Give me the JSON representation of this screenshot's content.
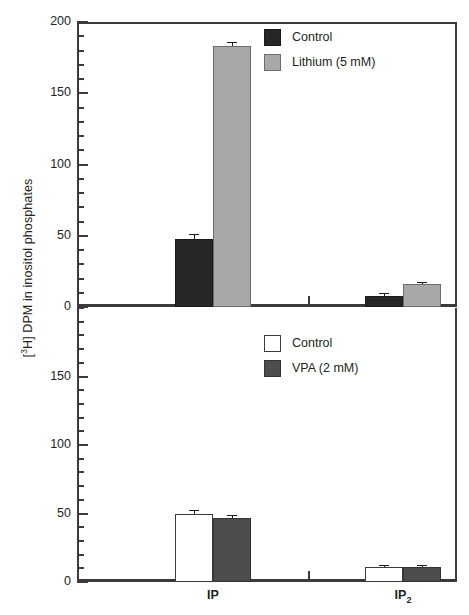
{
  "chart_data": {
    "type": "bar",
    "title": "",
    "xlabel": "",
    "ylabel": "[3H] DPM in inositol phosphates",
    "ylabel_prefix": "[",
    "ylabel_sup": "3",
    "ylabel_rest": "H] DPM in inositol phosphates",
    "categories": [
      "IP",
      "IP2"
    ],
    "category_labels": [
      {
        "base": "IP",
        "sub": ""
      },
      {
        "base": "IP",
        "sub": "2"
      }
    ],
    "panels": [
      {
        "id": "top",
        "ylim": [
          0,
          200
        ],
        "yticks": [
          0,
          50,
          100,
          150,
          200
        ],
        "ytick_labels": [
          "0",
          "50",
          "100",
          "150",
          "200"
        ],
        "minor_tick_step": 10,
        "grid": false,
        "legend_position": "top-right",
        "series": [
          {
            "name": "Control",
            "color": "#262626",
            "style": "black",
            "values": [
              48,
              8
            ],
            "errors": [
              2.5,
              1.2
            ]
          },
          {
            "name": "Lithium (5 mM)",
            "color": "#a8a8a8",
            "style": "lightgray",
            "values": [
              183,
              16
            ],
            "errors": [
              2.5,
              1.0
            ]
          }
        ]
      },
      {
        "id": "bottom",
        "ylim": [
          0,
          200
        ],
        "yticks": [
          0,
          50,
          100,
          150
        ],
        "ytick_labels": [
          "0",
          "50",
          "100",
          "150"
        ],
        "minor_tick_step": 10,
        "grid": false,
        "legend_position": "top-right",
        "series": [
          {
            "name": "Control",
            "color": "#ffffff",
            "style": "white",
            "values": [
              50,
              11
            ],
            "errors": [
              1.5,
              0.8
            ]
          },
          {
            "name": "VPA (2 mM)",
            "color": "#4d4d4d",
            "style": "darkgray",
            "values": [
              47,
              11
            ],
            "errors": [
              1.5,
              0.8
            ]
          }
        ]
      }
    ]
  },
  "legends": {
    "top": [
      {
        "label": "Control",
        "swatch": "black"
      },
      {
        "label": "Lithium (5 mM)",
        "swatch": "lightgray"
      }
    ],
    "bottom": [
      {
        "label": "Control",
        "swatch": "white"
      },
      {
        "label": "VPA (2 mM)",
        "swatch": "darkgray"
      }
    ]
  }
}
